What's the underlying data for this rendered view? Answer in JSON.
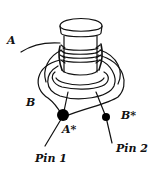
{
  "diagram": {
    "type": "coil-winding",
    "colors": {
      "stroke": "#111111",
      "background": "#ffffff",
      "terminal": "#000000"
    },
    "labels": {
      "wire_a": "A",
      "wire_b": "B",
      "terminal_a_star": "A*",
      "terminal_b_star": "B*",
      "pin1": "Pin 1",
      "pin2": "Pin 2"
    },
    "components": [
      {
        "id": "cap",
        "name": "coil-former-cap"
      },
      {
        "id": "core",
        "name": "coil-core-with-windings"
      },
      {
        "id": "flange",
        "name": "coil-former-flange"
      },
      {
        "id": "terminal_a_star",
        "name": "terminal A*",
        "connects_to": "Pin 1"
      },
      {
        "id": "terminal_b_star",
        "name": "terminal B*",
        "connects_to": "Pin 2"
      }
    ]
  }
}
